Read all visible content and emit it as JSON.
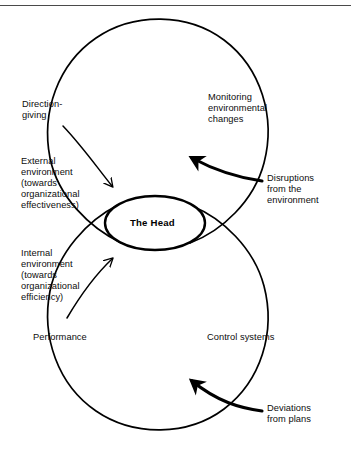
{
  "diagram": {
    "title_node": "The Head",
    "type": "dual-loop-feedback-diagram",
    "top_rule": true,
    "labels": {
      "direction_giving": "Direction-\ngiving",
      "external_environment": "External\nenvironment\n(towards\norganizational\neffectiveness)",
      "internal_environment": "Internal\nenvironment\n(towards\norganizational\nefficiency)",
      "performance": "Performance",
      "monitoring": "Monitoring\nenvironmental\nchanges",
      "disruptions": "Disruptions\nfrom the\nenvironment",
      "control_systems": "Control systems",
      "deviations": "Deviations\nfrom plans"
    },
    "colors": {
      "ink": "#000000",
      "background": "#ffffff",
      "rule": "#4a4a4a"
    },
    "geometry": {
      "top_loop": {
        "cx": 163,
        "cy": 135,
        "r": 114
      },
      "bottom_loop": {
        "cx": 163,
        "cy": 315,
        "r": 114
      },
      "head_ellipse": {
        "cx": 155,
        "cy": 223,
        "rx": 50,
        "ry": 27
      }
    }
  }
}
